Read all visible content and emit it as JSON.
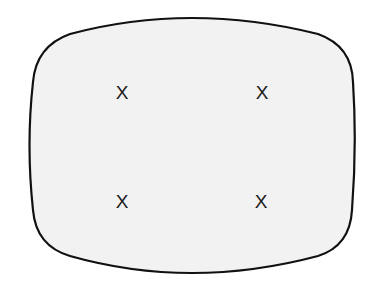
{
  "diagram": {
    "title": "",
    "screen": {
      "label": "crt-screen-outline",
      "fill_color": "#f2f2f2",
      "stroke_color": "#111111"
    },
    "marks": [
      {
        "id": "top-left",
        "text": "X"
      },
      {
        "id": "top-right",
        "text": "X"
      },
      {
        "id": "bottom-left",
        "text": "X"
      },
      {
        "id": "bottom-right",
        "text": "X"
      }
    ]
  }
}
